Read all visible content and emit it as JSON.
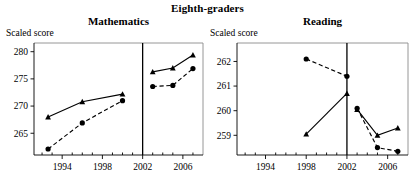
{
  "header": {
    "suptitle": "Eighth-graders"
  },
  "panels": [
    {
      "key": "mathematics",
      "title": "Mathematics",
      "ylabel": "Scaled score"
    },
    {
      "key": "reading",
      "title": "Reading",
      "ylabel": "Scaled score"
    }
  ],
  "chart_data": [
    {
      "type": "line",
      "title": "Mathematics",
      "suptitle": "Eighth-graders",
      "xlabel": "",
      "ylabel": "Scaled score",
      "xlim": [
        1991.2,
        2008.0
      ],
      "ylim": [
        261.0,
        281.6
      ],
      "xticks": [
        1994,
        1998,
        2002,
        2006
      ],
      "xtick_labels": [
        "1994",
        "1998",
        "2002",
        "2006"
      ],
      "yticks": [
        265,
        270,
        275,
        280
      ],
      "ytick_labels": [
        "265",
        "270",
        "275",
        "280"
      ],
      "minor_xticks": [
        1992,
        1993,
        1995,
        1996,
        1997,
        1999,
        2000,
        2001,
        2003,
        2004,
        2005,
        2007
      ],
      "grid": false,
      "legend": "none",
      "divider_x": 2002,
      "series": [
        {
          "name": "solid-triangle",
          "marker": "triangle",
          "linestyle": "solid",
          "segments": [
            {
              "period": "pre-2002",
              "x": [
                1992.6,
                1996.0,
                2000.0
              ],
              "y": [
                268.0,
                270.8,
                272.2
              ]
            },
            {
              "period": "post-2002",
              "x": [
                2003.0,
                2005.0,
                2007.0
              ],
              "y": [
                276.3,
                277.0,
                279.4
              ]
            }
          ]
        },
        {
          "name": "dashed-circle",
          "marker": "circle",
          "linestyle": "dashed",
          "segments": [
            {
              "period": "pre-2002",
              "x": [
                1992.6,
                1996.0,
                2000.0
              ],
              "y": [
                262.1,
                266.9,
                271.0
              ]
            },
            {
              "period": "post-2002",
              "x": [
                2003.0,
                2005.0,
                2007.0
              ],
              "y": [
                273.6,
                273.8,
                276.9
              ]
            }
          ]
        }
      ]
    },
    {
      "type": "line",
      "title": "Reading",
      "suptitle": "Eighth-graders",
      "xlabel": "",
      "ylabel": "Scaled score",
      "xlim": [
        1991.2,
        2008.0
      ],
      "ylim": [
        258.2,
        262.75
      ],
      "xticks": [
        1994,
        1998,
        2002,
        2006
      ],
      "xtick_labels": [
        "1994",
        "1998",
        "2002",
        "2006"
      ],
      "yticks": [
        259,
        260,
        261,
        262
      ],
      "ytick_labels": [
        "259",
        "260",
        "261",
        "262"
      ],
      "minor_xticks": [
        1992,
        1993,
        1995,
        1996,
        1997,
        1999,
        2000,
        2001,
        2003,
        2004,
        2005,
        2007
      ],
      "grid": false,
      "legend": "none",
      "divider_x": 2002,
      "series": [
        {
          "name": "dashed-circle",
          "marker": "circle",
          "linestyle": "dashed",
          "segments": [
            {
              "period": "pre-2002",
              "x": [
                1998.0,
                2002.0
              ],
              "y": [
                262.1,
                261.4
              ]
            },
            {
              "period": "post-2002",
              "x": [
                2003.0,
                2005.0,
                2007.0
              ],
              "y": [
                260.1,
                258.5,
                258.35
              ]
            }
          ]
        },
        {
          "name": "solid-triangle",
          "marker": "triangle",
          "linestyle": "solid",
          "segments": [
            {
              "period": "pre-2002",
              "x": [
                1998.0,
                2002.0
              ],
              "y": [
                259.05,
                260.7
              ]
            },
            {
              "period": "post-2002",
              "x": [
                2003.0,
                2005.0,
                2007.0
              ],
              "y": [
                260.05,
                259.0,
                259.3
              ]
            }
          ]
        }
      ]
    }
  ]
}
